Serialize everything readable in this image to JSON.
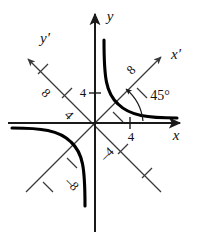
{
  "figure": {
    "kind": "rotated-axes-hyperbola-diagram",
    "axes": {
      "x_label": "x",
      "y_label": "y",
      "x_prime_label": "x′",
      "y_prime_label": "y′"
    },
    "angle": {
      "label": "45°",
      "value": 45,
      "from_axis": "x",
      "to_axis": "x′"
    },
    "ticks": {
      "x_axis": [
        {
          "label": "4",
          "value": 4
        }
      ],
      "y_axis": [
        {
          "label": "4",
          "value": 4
        }
      ],
      "x_prime_positive": [
        {
          "label": "",
          "value": 4
        },
        {
          "label": "8",
          "value": 8
        }
      ],
      "x_prime_negative": [
        {
          "label": "–4",
          "value": -4
        },
        {
          "label": "",
          "value": -8
        }
      ],
      "y_prime_positive": [
        {
          "label": "4",
          "value": 4
        },
        {
          "label": "8",
          "value": 8
        }
      ],
      "y_prime_negative": [
        {
          "label": "",
          "value": -4
        },
        {
          "label": "–8",
          "value": -8
        }
      ]
    },
    "colors": {
      "curve": "#000000",
      "axis": "#1a1a1a",
      "primed_axis": "#3a3a3a",
      "background": "#ffffff"
    }
  }
}
